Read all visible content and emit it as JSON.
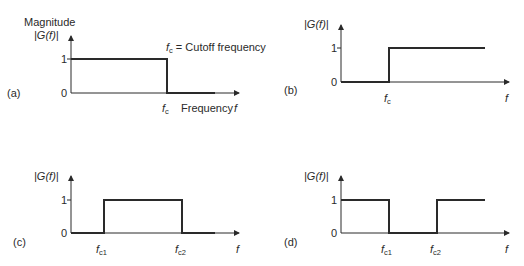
{
  "figure": {
    "colors": {
      "line": "#2a2a2a",
      "background": "#ffffff"
    },
    "panels": [
      {
        "id": "a",
        "tag": "(a)",
        "type": "low-pass",
        "y_title": "Magnitude",
        "y_label": "|G(f)|",
        "y_ticks": [
          "1",
          "0"
        ],
        "x_labels": [
          {
            "sym": "f",
            "sub": "c"
          }
        ],
        "x_axis_label": "Frequency",
        "x_axis_var": "f",
        "annotation": {
          "sym": "f",
          "sub": "c",
          "text": " = Cutoff frequency"
        }
      },
      {
        "id": "b",
        "tag": "(b)",
        "type": "high-pass",
        "y_label": "|G(f)|",
        "y_ticks": [
          "1",
          "0"
        ],
        "x_labels": [
          {
            "sym": "f",
            "sub": "c"
          }
        ],
        "x_axis_var": "f"
      },
      {
        "id": "c",
        "tag": "(c)",
        "type": "band-pass",
        "y_label": "|G(f)|",
        "y_ticks": [
          "1",
          "0"
        ],
        "x_labels": [
          {
            "sym": "f",
            "sub": "c1"
          },
          {
            "sym": "f",
            "sub": "c2"
          }
        ],
        "x_axis_var": "f"
      },
      {
        "id": "d",
        "tag": "(d)",
        "type": "band-stop",
        "y_label": "|G(f)|",
        "y_ticks": [
          "1",
          "0"
        ],
        "x_labels": [
          {
            "sym": "f",
            "sub": "c1"
          },
          {
            "sym": "f",
            "sub": "c2"
          }
        ],
        "x_axis_var": "f"
      }
    ]
  }
}
